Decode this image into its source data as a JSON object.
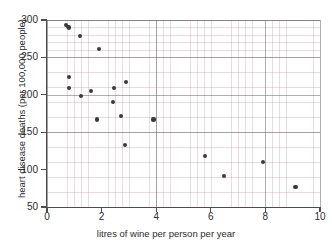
{
  "chart_data": {
    "type": "scatter",
    "title": "",
    "xlabel": "litres of wine per person per year",
    "ylabel": "heart disease deaths (per 100,000 people)",
    "xlim": [
      0,
      10
    ],
    "ylim": [
      50,
      300
    ],
    "xticks": [
      0,
      2,
      4,
      6,
      8,
      10
    ],
    "yticks": [
      50,
      100,
      150,
      200,
      250,
      300
    ],
    "xtick_labels": [
      "0",
      "2",
      "4",
      "6",
      "8",
      "10"
    ],
    "ytick_labels": [
      "50",
      "100",
      "150",
      "200",
      "250",
      "300"
    ],
    "grid": true,
    "grid_minor": true,
    "legend": "none",
    "marker": "filled-circle",
    "marker_color": "#3a3a3a",
    "points": [
      {
        "x": 0.7,
        "y": 293
      },
      {
        "x": 0.78,
        "y": 291
      },
      {
        "x": 0.82,
        "y": 290
      },
      {
        "x": 1.22,
        "y": 279
      },
      {
        "x": 1.9,
        "y": 261
      },
      {
        "x": 0.82,
        "y": 224
      },
      {
        "x": 0.82,
        "y": 209
      },
      {
        "x": 1.25,
        "y": 198
      },
      {
        "x": 1.6,
        "y": 205
      },
      {
        "x": 1.82,
        "y": 167
      },
      {
        "x": 2.42,
        "y": 190
      },
      {
        "x": 2.45,
        "y": 209
      },
      {
        "x": 2.7,
        "y": 172
      },
      {
        "x": 2.88,
        "y": 217
      },
      {
        "x": 2.85,
        "y": 133
      },
      {
        "x": 3.9,
        "y": 167
      },
      {
        "x": 5.78,
        "y": 118
      },
      {
        "x": 6.48,
        "y": 91
      },
      {
        "x": 7.9,
        "y": 110
      },
      {
        "x": 9.1,
        "y": 77
      }
    ]
  },
  "colors": {
    "background": "#ffffff",
    "axis": "#4d4d4d",
    "text": "#2b2b2b",
    "grid_major": "#6e6e73",
    "grid_minor": "#cda5aa",
    "marker": "#3a3a3a"
  }
}
